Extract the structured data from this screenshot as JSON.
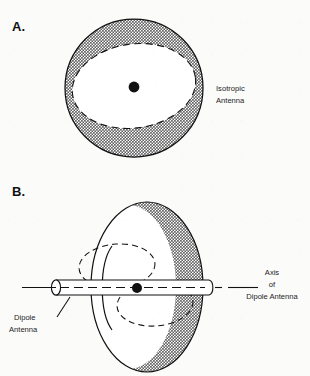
{
  "figure": {
    "panels": [
      {
        "letter": "A.",
        "name": "isotropic-antenna-panel",
        "label": {
          "line1": "Isotropic",
          "line2": "Antenna"
        }
      },
      {
        "letter": "B.",
        "name": "dipole-antenna-panel",
        "label_left": {
          "line1": "Dipole",
          "line2": "Antenna"
        },
        "label_right": {
          "line1": "Axis",
          "line2": "of",
          "line3": "Dipole Antenna"
        }
      }
    ],
    "colors": {
      "ink": "#111111",
      "halftone_gray": "#b8b8b8",
      "paper": "#fbfbfa",
      "field_white": "#ffffff"
    }
  }
}
